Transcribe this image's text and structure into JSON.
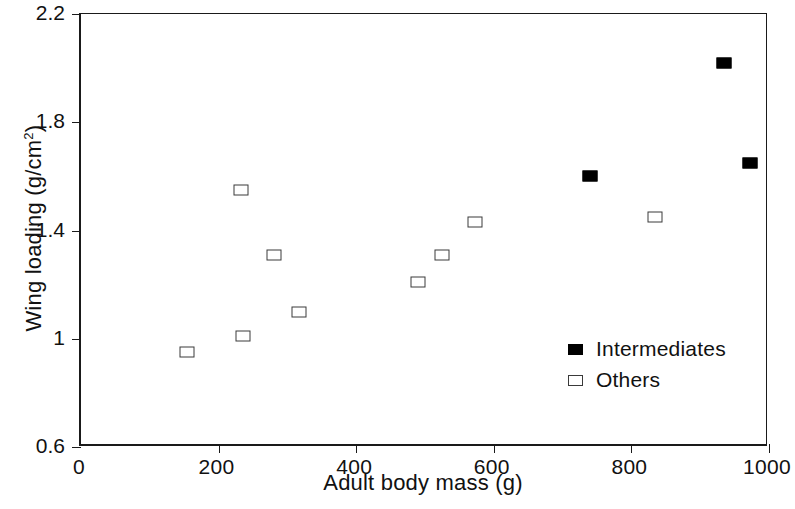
{
  "chart_data": {
    "type": "scatter",
    "title": "",
    "xlabel": "Adult body mass (g)",
    "ylabel": "Wing loading (g/cm2)",
    "ylabel_display": "Wing loading (g/cm",
    "ylabel_exponent": "2",
    "ylabel_suffix": ")",
    "xlim": [
      0,
      1000
    ],
    "ylim": [
      0.6,
      2.2
    ],
    "xticks": [
      0,
      200,
      400,
      600,
      800,
      1000
    ],
    "xtick_labels": [
      "0",
      "200",
      "400",
      "600",
      "800",
      "1000"
    ],
    "yticks": [
      0.6,
      1.0,
      1.4,
      1.8,
      2.2
    ],
    "ytick_labels": [
      "0.6",
      "1",
      "1.4",
      "1.8",
      "2.2"
    ],
    "grid": false,
    "legend_position": "inside-lower-right",
    "series": [
      {
        "name": "Intermediates",
        "marker": "filled-square",
        "color": "#000000",
        "points": [
          {
            "x": 740,
            "y": 1.6
          },
          {
            "x": 935,
            "y": 2.02
          },
          {
            "x": 973,
            "y": 1.65
          }
        ]
      },
      {
        "name": "Others",
        "marker": "open-square",
        "color": "#ffffff",
        "edge_color": "#3a3a3a",
        "points": [
          {
            "x": 154,
            "y": 0.95
          },
          {
            "x": 236,
            "y": 1.01
          },
          {
            "x": 233,
            "y": 1.55
          },
          {
            "x": 281,
            "y": 1.31
          },
          {
            "x": 317,
            "y": 1.1
          },
          {
            "x": 490,
            "y": 1.21
          },
          {
            "x": 525,
            "y": 1.31
          },
          {
            "x": 572,
            "y": 1.43
          },
          {
            "x": 834,
            "y": 1.45
          }
        ]
      }
    ]
  },
  "legend": {
    "entries": [
      {
        "label": "Intermediates",
        "marker": "filled-square"
      },
      {
        "label": "Others",
        "marker": "open-square"
      }
    ]
  }
}
